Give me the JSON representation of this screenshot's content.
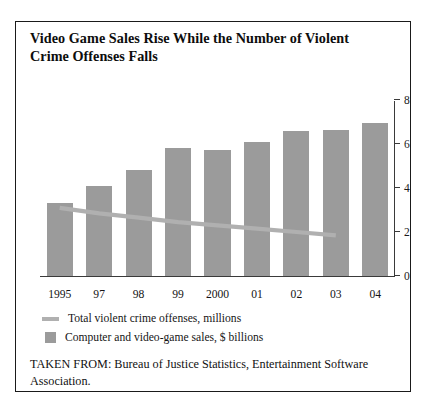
{
  "chart_data": {
    "type": "bar",
    "title": "Video Game Sales Rise While the Number of Violent Crime Offenses Falls",
    "xlabel": "",
    "ylabel": "",
    "ylim": [
      0,
      8
    ],
    "yticks": [
      0,
      2,
      4,
      6,
      8
    ],
    "grid": false,
    "legend_position": "below-plot",
    "categories": [
      "1995",
      "97",
      "98",
      "99",
      "2000",
      "01",
      "02",
      "03",
      "04"
    ],
    "series": [
      {
        "name": "Computer and video-game sales, $ billions",
        "type": "bar",
        "color": "#9b9b9b",
        "values": [
          3.3,
          4.1,
          4.8,
          5.8,
          5.75,
          6.1,
          6.6,
          6.65,
          6.95
        ]
      },
      {
        "name": "Total violent crime offenses, millions",
        "type": "line",
        "color": "#b0b0b0",
        "x": [
          "1995",
          "97",
          "98",
          "99",
          "2000",
          "01",
          "02",
          "03"
        ],
        "values": [
          3.1,
          2.85,
          2.65,
          2.45,
          2.3,
          2.15,
          2.0,
          1.85
        ]
      }
    ],
    "source": "TAKEN FROM: Bureau of Justice Statistics, Entertainment Software Association."
  },
  "title": {
    "text": "Video Game Sales Rise While the Number of Violent Crime Offenses Falls"
  },
  "axis": {
    "y_tick_labels": [
      "8",
      "6",
      "4",
      "2",
      "0"
    ]
  },
  "legend": {
    "items": [
      {
        "label": "Total violent crime offenses, millions",
        "marker": "line-swatch"
      },
      {
        "label": "Computer and video-game sales, $ billions",
        "marker": "square-swatch"
      }
    ]
  },
  "source": {
    "text": "TAKEN FROM: Bureau of Justice Statistics, Entertainment Software Association."
  }
}
